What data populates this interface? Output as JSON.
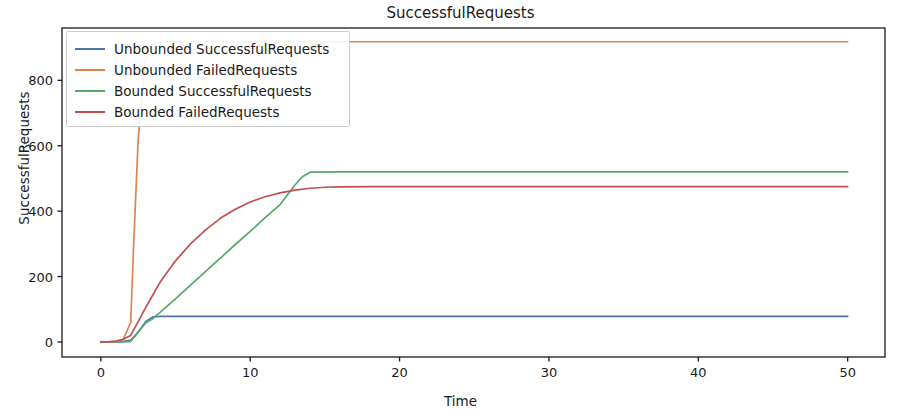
{
  "chart_data": {
    "type": "line",
    "title": "SuccessfulRequests",
    "xlabel": "Time",
    "ylabel": "SuccessfulRequests",
    "xlim": [
      -2.6,
      52.5
    ],
    "ylim": [
      -46,
      960
    ],
    "xticks": [
      0,
      10,
      20,
      30,
      40,
      50
    ],
    "yticks": [
      0,
      200,
      400,
      600,
      800
    ],
    "grid": false,
    "legend_position": "upper left",
    "series": [
      {
        "name": "Unbounded SuccessfulRequests",
        "color": "#4c72b0",
        "x": [
          0,
          0.5,
          1,
          1.5,
          2,
          2.5,
          3,
          3.5,
          4,
          5,
          8,
          12,
          16,
          20,
          25,
          30,
          35,
          40,
          45,
          50
        ],
        "values": [
          0,
          0,
          1,
          2,
          5,
          30,
          62,
          77,
          78,
          78,
          78,
          78,
          78,
          78,
          78,
          78,
          78,
          78,
          78,
          78
        ]
      },
      {
        "name": "Unbounded FailedRequests",
        "color": "#dd8452",
        "x": [
          0,
          0.5,
          1,
          1.5,
          2,
          2.2,
          2.5,
          3,
          3.5,
          4,
          5,
          8,
          12,
          16,
          20,
          25,
          30,
          35,
          40,
          45,
          50
        ],
        "values": [
          0,
          0,
          2,
          8,
          60,
          300,
          620,
          870,
          912,
          918,
          918,
          918,
          918,
          918,
          918,
          918,
          918,
          918,
          918,
          918,
          918
        ]
      },
      {
        "name": "Bounded SuccessfulRequests",
        "color": "#55a868",
        "x": [
          0,
          0.5,
          1,
          1.5,
          2,
          2.5,
          3,
          3.5,
          4,
          5,
          6,
          7,
          8,
          9,
          10,
          11,
          12,
          12.5,
          13,
          13.5,
          14,
          16,
          20,
          25,
          30,
          35,
          40,
          45,
          50
        ],
        "values": [
          0,
          0,
          0,
          0,
          2,
          30,
          58,
          72,
          92,
          132,
          174,
          215,
          256,
          298,
          338,
          380,
          420,
          450,
          480,
          505,
          519,
          520,
          520,
          520,
          520,
          520,
          520,
          520,
          520
        ]
      },
      {
        "name": "Bounded FailedRequests",
        "color": "#c44e52",
        "x": [
          0,
          0.5,
          1,
          1.5,
          2,
          2.5,
          3,
          3.5,
          4,
          5,
          6,
          7,
          8,
          9,
          10,
          11,
          12,
          13,
          14,
          15,
          16,
          18,
          20,
          25,
          30,
          35,
          40,
          45,
          50
        ],
        "values": [
          0,
          0,
          2,
          8,
          20,
          62,
          105,
          145,
          185,
          248,
          300,
          342,
          378,
          406,
          428,
          444,
          456,
          464,
          470,
          473,
          474,
          475,
          475,
          475,
          475,
          475,
          475,
          475,
          475
        ]
      }
    ]
  },
  "axes": {
    "title": "SuccessfulRequests",
    "xlabel": "Time",
    "ylabel": "SuccessfulRequests",
    "xtick_labels": [
      "0",
      "10",
      "20",
      "30",
      "40",
      "50"
    ],
    "ytick_labels": [
      "0",
      "200",
      "400",
      "600",
      "800"
    ]
  },
  "legend": {
    "entries": [
      {
        "label": "Unbounded SuccessfulRequests",
        "color": "#4c72b0"
      },
      {
        "label": "Unbounded FailedRequests",
        "color": "#dd8452"
      },
      {
        "label": "Bounded SuccessfulRequests",
        "color": "#55a868"
      },
      {
        "label": "Bounded FailedRequests",
        "color": "#c44e52"
      }
    ]
  }
}
